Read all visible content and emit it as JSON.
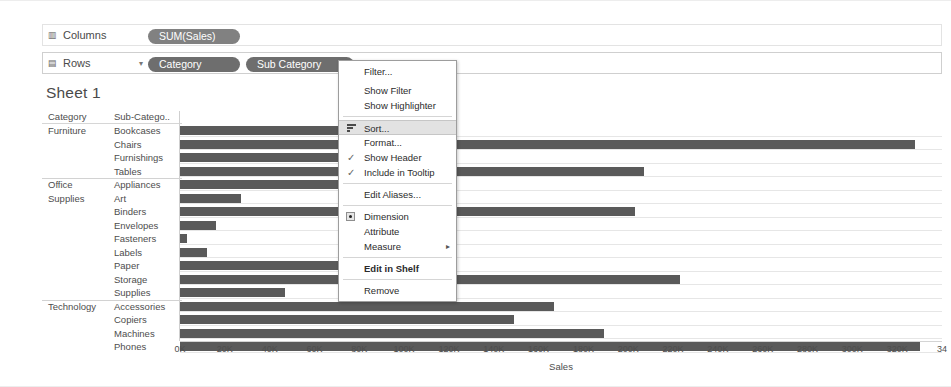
{
  "shelves": {
    "columns": {
      "label": "Columns",
      "icon": "columns-icon",
      "pills": [
        {
          "text": "SUM(Sales)",
          "type": "measure"
        }
      ]
    },
    "rows": {
      "label": "Rows",
      "icon": "rows-icon",
      "caret": "▾",
      "pills": [
        {
          "text": "Category",
          "type": "dimension"
        },
        {
          "text": "Sub Category",
          "type": "dimension"
        }
      ]
    }
  },
  "worksheet": {
    "title": "Sheet 1",
    "column_headers": [
      "Category",
      "Sub-Catego.."
    ]
  },
  "context_menu": {
    "items": [
      {
        "label": "Filter...",
        "type": "item"
      },
      {
        "type": "gap"
      },
      {
        "label": "Show Filter",
        "type": "item"
      },
      {
        "label": "Show Highlighter",
        "type": "item"
      },
      {
        "type": "sep"
      },
      {
        "label": "Sort...",
        "type": "item",
        "icon": "sort-icon",
        "highlighted": true
      },
      {
        "label": "Format...",
        "type": "item"
      },
      {
        "label": "Show Header",
        "type": "item",
        "checked": true
      },
      {
        "label": "Include in Tooltip",
        "type": "item",
        "checked": true
      },
      {
        "type": "sep"
      },
      {
        "label": "Edit Aliases...",
        "type": "item"
      },
      {
        "type": "sep"
      },
      {
        "label": "Dimension",
        "type": "item",
        "radio": true
      },
      {
        "label": "Attribute",
        "type": "item"
      },
      {
        "label": "Measure",
        "type": "item",
        "submenu": true,
        "arrow": "▸"
      },
      {
        "type": "sep"
      },
      {
        "label": "Edit in Shelf",
        "type": "item",
        "bold": true
      },
      {
        "type": "sep"
      },
      {
        "label": "Remove",
        "type": "item"
      }
    ]
  },
  "chart_data": {
    "type": "bar",
    "title": "Sheet 1",
    "orientation": "horizontal",
    "xlabel": "Sales",
    "ylabel": "",
    "xlim": [
      0,
      340000
    ],
    "xticks": [
      "0K",
      "20K",
      "40K",
      "60K",
      "80K",
      "100K",
      "120K",
      "140K",
      "160K",
      "180K",
      "200K",
      "220K",
      "240K",
      "260K",
      "280K",
      "300K",
      "320K",
      "34"
    ],
    "xtick_values": [
      0,
      20000,
      40000,
      60000,
      80000,
      100000,
      120000,
      140000,
      160000,
      180000,
      200000,
      220000,
      240000,
      260000,
      280000,
      300000,
      320000,
      340000
    ],
    "grid": true,
    "legend": "none",
    "bar_color": "#5a5a5a",
    "groups": [
      {
        "category": "Furniture",
        "category_lines": [
          "Furniture"
        ],
        "rows": [
          {
            "sub_category": "Bookcases",
            "value": 115000
          },
          {
            "sub_category": "Chairs",
            "value": 328000
          },
          {
            "sub_category": "Furnishings",
            "value": 91000
          },
          {
            "sub_category": "Tables",
            "value": 207000
          }
        ]
      },
      {
        "category": "Office Supplies",
        "category_lines": [
          "Office",
          "Supplies"
        ],
        "rows": [
          {
            "sub_category": "Appliances",
            "value": 107000
          },
          {
            "sub_category": "Art",
            "value": 27000
          },
          {
            "sub_category": "Binders",
            "value": 203000
          },
          {
            "sub_category": "Envelopes",
            "value": 16000
          },
          {
            "sub_category": "Fasteners",
            "value": 3000
          },
          {
            "sub_category": "Labels",
            "value": 12000
          },
          {
            "sub_category": "Paper",
            "value": 78000
          },
          {
            "sub_category": "Storage",
            "value": 223000
          },
          {
            "sub_category": "Supplies",
            "value": 47000
          }
        ]
      },
      {
        "category": "Technology",
        "category_lines": [
          "Technology"
        ],
        "rows": [
          {
            "sub_category": "Accessories",
            "value": 167000
          },
          {
            "sub_category": "Copiers",
            "value": 149000
          },
          {
            "sub_category": "Machines",
            "value": 189000
          },
          {
            "sub_category": "Phones",
            "value": 330000
          }
        ]
      }
    ]
  }
}
